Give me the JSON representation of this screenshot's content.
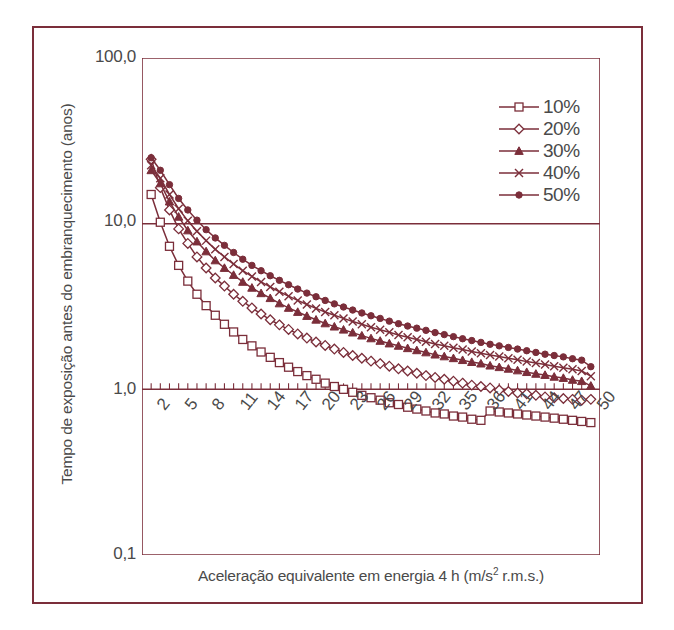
{
  "figure": {
    "frame_color": "#7B2E3A",
    "line_color": "#7B2E3A",
    "text_color": "#4a4a4a",
    "background": "#ffffff"
  },
  "axes": {
    "y_title": "Tempo de exposição antes do embranquecimento (anos)",
    "x_title_main": "Aceleração equivalente em energia 4 h (m/s",
    "x_title_sup": "2",
    "x_title_tail": " r.m.s.)",
    "y_ticks": [
      "100,0",
      "10,0",
      "1,0",
      "0,1"
    ],
    "x_ticks": [
      "2",
      "5",
      "8",
      "11",
      "14",
      "17",
      "20",
      "23",
      "26",
      "29",
      "32",
      "35",
      "36",
      "41",
      "44",
      "47",
      "50"
    ]
  },
  "legend": {
    "items": [
      {
        "label": "10%",
        "marker": "square-open-marker"
      },
      {
        "label": "20%",
        "marker": "diamond-open-marker"
      },
      {
        "label": "30%",
        "marker": "triangle-filled-marker"
      },
      {
        "label": "40%",
        "marker": "x-cross-marker"
      },
      {
        "label": "50%",
        "marker": "circle-filled-marker"
      }
    ]
  },
  "chart_data": {
    "type": "line",
    "title": "",
    "xlabel": "Aceleração equivalente em energia 4 h (m/s2 r.m.s.)",
    "ylabel": "Tempo de exposição antes do embranquecimento (anos)",
    "xlim": [
      1,
      51
    ],
    "ylim": [
      0.1,
      100
    ],
    "yscale": "log",
    "xscale": "linear",
    "grid": false,
    "legend_position": "top-right",
    "x": [
      2,
      3,
      4,
      5,
      6,
      7,
      8,
      9,
      10,
      11,
      12,
      13,
      14,
      15,
      16,
      17,
      18,
      19,
      20,
      21,
      22,
      23,
      24,
      25,
      26,
      27,
      28,
      29,
      30,
      31,
      32,
      33,
      34,
      35,
      36,
      37,
      38,
      39,
      40,
      41,
      42,
      43,
      44,
      45,
      46,
      47,
      48,
      49,
      50
    ],
    "series": [
      {
        "name": "10%",
        "marker": "square-open",
        "values": [
          15.0,
          10.2,
          7.3,
          5.6,
          4.5,
          3.75,
          3.2,
          2.8,
          2.47,
          2.22,
          2.0,
          1.83,
          1.68,
          1.56,
          1.45,
          1.36,
          1.28,
          1.21,
          1.15,
          1.09,
          1.04,
          1.0,
          0.96,
          0.92,
          0.89,
          0.86,
          0.83,
          0.81,
          0.78,
          0.76,
          0.74,
          0.72,
          0.71,
          0.69,
          0.68,
          0.66,
          0.65,
          0.74,
          0.73,
          0.72,
          0.71,
          0.7,
          0.69,
          0.68,
          0.67,
          0.66,
          0.65,
          0.64,
          0.63
        ]
      },
      {
        "name": "20%",
        "marker": "diamond-open",
        "values": [
          24.5,
          16.5,
          12.1,
          9.3,
          7.6,
          6.3,
          5.4,
          4.7,
          4.2,
          3.75,
          3.4,
          3.1,
          2.85,
          2.63,
          2.45,
          2.3,
          2.16,
          2.04,
          1.93,
          1.84,
          1.75,
          1.67,
          1.6,
          1.54,
          1.48,
          1.43,
          1.38,
          1.33,
          1.29,
          1.25,
          1.21,
          1.18,
          1.15,
          1.12,
          1.09,
          1.06,
          1.04,
          1.02,
          0.99,
          0.97,
          0.95,
          0.94,
          0.92,
          0.9,
          0.89,
          0.88,
          0.87,
          0.86,
          0.87
        ]
      },
      {
        "name": "30%",
        "marker": "triangle-filled",
        "values": [
          21.0,
          17.5,
          13.6,
          11.0,
          9.1,
          7.8,
          6.8,
          6.0,
          5.4,
          4.9,
          4.45,
          4.1,
          3.8,
          3.55,
          3.3,
          3.1,
          2.93,
          2.77,
          2.63,
          2.5,
          2.39,
          2.29,
          2.2,
          2.11,
          2.03,
          1.96,
          1.89,
          1.83,
          1.77,
          1.72,
          1.67,
          1.62,
          1.58,
          1.54,
          1.5,
          1.46,
          1.43,
          1.39,
          1.36,
          1.33,
          1.3,
          1.27,
          1.24,
          1.22,
          1.19,
          1.17,
          1.14,
          1.12,
          1.05
        ]
      },
      {
        "name": "40%",
        "marker": "x-cross",
        "values": [
          22.5,
          18.8,
          15.0,
          12.3,
          10.4,
          9.0,
          7.9,
          7.0,
          6.3,
          5.7,
          5.2,
          4.8,
          4.45,
          4.15,
          3.88,
          3.65,
          3.44,
          3.25,
          3.08,
          2.93,
          2.8,
          2.68,
          2.57,
          2.47,
          2.37,
          2.29,
          2.21,
          2.13,
          2.06,
          2.0,
          1.94,
          1.88,
          1.83,
          1.78,
          1.74,
          1.69,
          1.65,
          1.61,
          1.58,
          1.54,
          1.51,
          1.47,
          1.44,
          1.41,
          1.38,
          1.35,
          1.32,
          1.29,
          1.2
        ]
      },
      {
        "name": "50%",
        "marker": "circle-filled",
        "values": [
          25.0,
          21.0,
          17.2,
          14.2,
          12.1,
          10.5,
          9.2,
          8.2,
          7.4,
          6.7,
          6.1,
          5.6,
          5.2,
          4.85,
          4.55,
          4.28,
          4.03,
          3.81,
          3.62,
          3.44,
          3.28,
          3.14,
          3.01,
          2.89,
          2.78,
          2.68,
          2.58,
          2.49,
          2.41,
          2.34,
          2.27,
          2.2,
          2.14,
          2.08,
          2.02,
          1.97,
          1.92,
          1.87,
          1.83,
          1.79,
          1.75,
          1.71,
          1.67,
          1.63,
          1.6,
          1.57,
          1.53,
          1.5,
          1.37
        ]
      }
    ]
  }
}
